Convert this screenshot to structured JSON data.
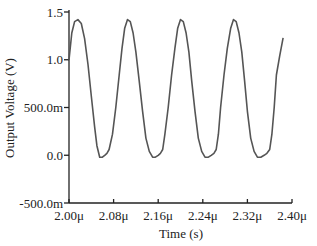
{
  "chart_data": {
    "type": "line",
    "title": "",
    "xlabel": "Time (s)",
    "ylabel": "Output Voltage (V)",
    "xlim": [
      2e-06,
      2.4e-06
    ],
    "ylim": [
      -0.5,
      1.5
    ],
    "grid": false,
    "legend": null,
    "x_ticks": [
      {
        "value": 2e-06,
        "label": "2.00μ"
      },
      {
        "value": 2.08e-06,
        "label": "2.08μ"
      },
      {
        "value": 2.16e-06,
        "label": "2.16μ"
      },
      {
        "value": 2.24e-06,
        "label": "2.24μ"
      },
      {
        "value": 2.32e-06,
        "label": "2.32μ"
      },
      {
        "value": 2.4e-06,
        "label": "2.40μ"
      }
    ],
    "y_ticks": [
      {
        "value": 1.5,
        "label": "1.5"
      },
      {
        "value": 1.0,
        "label": "1.0"
      },
      {
        "value": 0.5,
        "label": "500.0m"
      },
      {
        "value": 0.0,
        "label": "0.0"
      },
      {
        "value": -0.5,
        "label": "-500.0m"
      }
    ],
    "series": [
      {
        "name": "Output Voltage",
        "color": "#555555",
        "description": "Periodic half-rectified-sine-like waveform, period ~0.1us, peak ~1.42V, clipped near 0V",
        "x_us": [
          2.0,
          2.005,
          2.01,
          2.016,
          2.022,
          2.028,
          2.034,
          2.04,
          2.046,
          2.05,
          2.055,
          2.06,
          2.064,
          2.068,
          2.072,
          2.078,
          2.084,
          2.09,
          2.095,
          2.1,
          2.105,
          2.11,
          2.115,
          2.12,
          2.126,
          2.132,
          2.138,
          2.144,
          2.15,
          2.155,
          2.16,
          2.164,
          2.168,
          2.172,
          2.178,
          2.184,
          2.19,
          2.195,
          2.2,
          2.205,
          2.21,
          2.215,
          2.22,
          2.226,
          2.232,
          2.238,
          2.244,
          2.25,
          2.255,
          2.26,
          2.264,
          2.268,
          2.272,
          2.278,
          2.284,
          2.29,
          2.295,
          2.3,
          2.305,
          2.31,
          2.315,
          2.32,
          2.326,
          2.332,
          2.338,
          2.344,
          2.35,
          2.355,
          2.36,
          2.364,
          2.368,
          2.372,
          2.378,
          2.384,
          2.39,
          2.395,
          2.4
        ],
        "y": [
          1.0,
          1.28,
          1.4,
          1.42,
          1.38,
          1.22,
          0.95,
          0.62,
          0.3,
          0.1,
          -0.02,
          -0.02,
          0.0,
          0.02,
          0.06,
          0.22,
          0.5,
          0.84,
          1.12,
          1.33,
          1.42,
          1.4,
          1.28,
          1.08,
          0.78,
          0.46,
          0.18,
          0.04,
          -0.02,
          -0.02,
          0.0,
          0.02,
          0.06,
          0.22,
          0.5,
          0.84,
          1.12,
          1.33,
          1.42,
          1.4,
          1.28,
          1.08,
          0.78,
          0.46,
          0.18,
          0.04,
          -0.02,
          -0.02,
          0.0,
          0.02,
          0.06,
          0.22,
          0.5,
          0.84,
          1.12,
          1.33,
          1.42,
          1.4,
          1.28,
          1.08,
          0.78,
          0.46,
          0.18,
          0.04,
          -0.02,
          -0.02,
          0.0,
          0.02,
          0.06,
          0.22,
          0.5,
          0.84,
          1.04,
          1.23
        ]
      }
    ]
  },
  "axes": {
    "x_title": "Time (s)",
    "y_title": "Output Voltage (V)"
  }
}
